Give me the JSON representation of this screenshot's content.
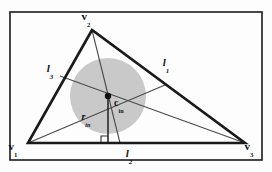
{
  "figure": {
    "caption": "",
    "background_color": "#fdfdfd",
    "frame_color": "#1a1a1a",
    "incircle_fill": "#c9c9c9",
    "triangle_stroke": "#1a1a1a",
    "bisector_stroke": "#4a4a4a",
    "label_color": "#111111"
  },
  "vertices": {
    "v1": {
      "label": "v",
      "sub": "1",
      "x": 28,
      "y": 143
    },
    "v2": {
      "label": "v",
      "sub": "2",
      "x": 92,
      "y": 30
    },
    "v3": {
      "label": "v",
      "sub": "3",
      "x": 245,
      "y": 143
    }
  },
  "vertex_labels": {
    "v1": {
      "text": "v",
      "sub": "1",
      "x": 13,
      "y": 150
    },
    "v2": {
      "text": "v",
      "sub": "2",
      "x": 86,
      "y": 20
    },
    "v3": {
      "text": "v",
      "sub": "3",
      "x": 249,
      "y": 150
    }
  },
  "incircle": {
    "center_x": 108,
    "center_y": 96,
    "radius": 38,
    "center_label": {
      "text": "c",
      "sub": "in",
      "x": 114,
      "y": 106
    },
    "radius_label": {
      "text": "r",
      "sub": "in",
      "x": 86,
      "y": 120
    },
    "center_dot_radius": 3.2
  },
  "sides": [
    {
      "name": "l1",
      "text": "l",
      "sub": "1",
      "x": 166,
      "y": 66,
      "from": "v2",
      "to": "v3"
    },
    {
      "name": "l2",
      "text": "l",
      "sub": "2",
      "x": 129,
      "y": 157,
      "from": "v1",
      "to": "v3"
    },
    {
      "name": "l3",
      "text": "l",
      "sub": "3",
      "x": 50,
      "y": 72,
      "from": "v1",
      "to": "v2"
    }
  ],
  "bisectors": [
    {
      "name": "bisector-from-v1",
      "x1": 28,
      "y1": 143,
      "x2": 165,
      "y2": 85
    },
    {
      "name": "bisector-from-v2",
      "x1": 92,
      "y1": 30,
      "x2": 120,
      "y2": 143
    },
    {
      "name": "bisector-from-v3",
      "x1": 245,
      "y1": 143,
      "x2": 60,
      "y2": 76
    }
  ],
  "radius_segment": {
    "x1": 108,
    "y1": 96,
    "x2": 108,
    "y2": 143
  },
  "right_angle_marker": {
    "x": 101,
    "y": 136,
    "size": 7
  },
  "frame": {
    "x": 10,
    "y": 12,
    "width": 252,
    "height": 148,
    "stroke_width": 1.6
  }
}
